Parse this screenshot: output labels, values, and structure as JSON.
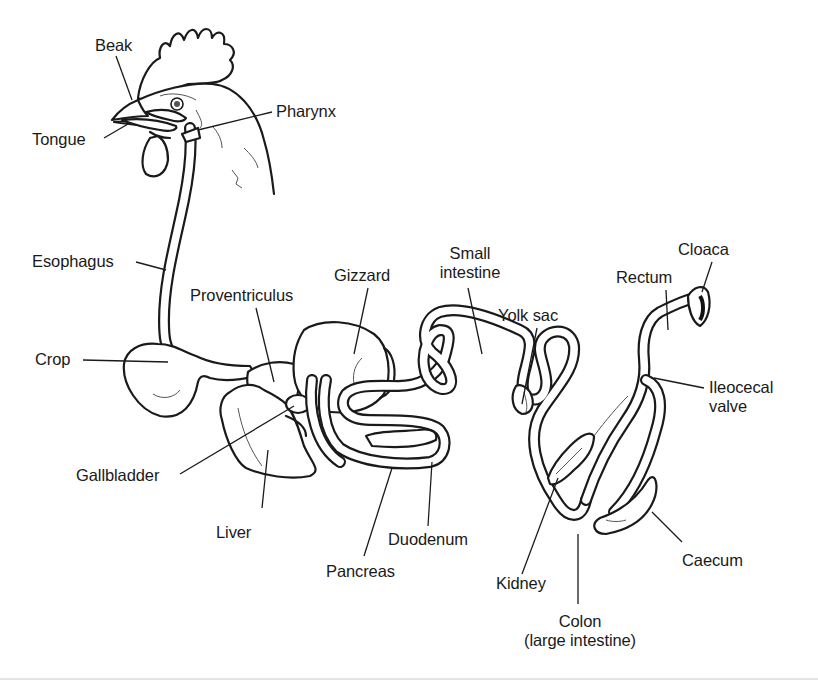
{
  "diagram": {
    "colors": {
      "line": "#1a1a1a",
      "background": "#ffffff",
      "faint_rule": "#e4e4e4"
    },
    "labels": [
      {
        "id": "beak",
        "text": "Beak"
      },
      {
        "id": "tongue",
        "text": "Tongue"
      },
      {
        "id": "pharynx",
        "text": "Pharynx"
      },
      {
        "id": "esophagus",
        "text": "Esophagus"
      },
      {
        "id": "crop",
        "text": "Crop"
      },
      {
        "id": "proventriculus",
        "text": "Proventriculus"
      },
      {
        "id": "gizzard",
        "text": "Gizzard"
      },
      {
        "id": "small_intestine",
        "text": [
          "Small",
          "intestine"
        ]
      },
      {
        "id": "yolk_sac",
        "text": "Yolk sac"
      },
      {
        "id": "rectum",
        "text": "Rectum"
      },
      {
        "id": "cloaca",
        "text": "Cloaca"
      },
      {
        "id": "ileocecal_valve",
        "text": [
          "Ileocecal",
          "valve"
        ]
      },
      {
        "id": "gallbladder",
        "text": "Gallbladder"
      },
      {
        "id": "liver",
        "text": "Liver"
      },
      {
        "id": "pancreas",
        "text": "Pancreas"
      },
      {
        "id": "duodenum",
        "text": "Duodenum"
      },
      {
        "id": "kidney",
        "text": "Kidney"
      },
      {
        "id": "colon",
        "text": [
          "Colon",
          "(large intestine)"
        ]
      },
      {
        "id": "caecum",
        "text": "Caecum"
      }
    ]
  }
}
